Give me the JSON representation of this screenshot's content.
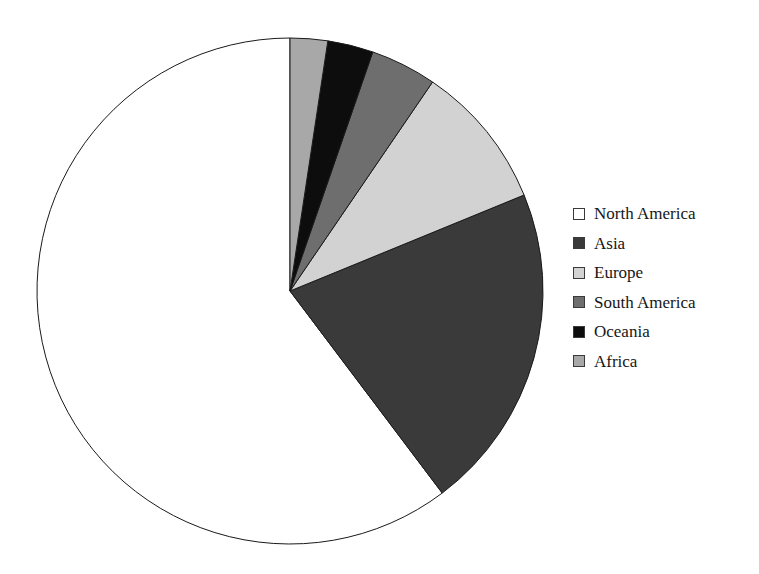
{
  "chart_data": {
    "type": "pie",
    "title": "",
    "subtitle": "",
    "xlabel": "",
    "ylabel": "",
    "grid": false,
    "legend_position": "right",
    "start_angle_deg": 0,
    "direction": "counterclockwise",
    "categories": [
      "North America",
      "Asia",
      "Europe",
      "South America",
      "Oceania",
      "Africa"
    ],
    "values": [
      60.3,
      20.9,
      9.3,
      4.2,
      2.9,
      2.4
    ],
    "value_unit": "percent",
    "slices": [
      {
        "label": "North America",
        "value": 60.3,
        "angle_deg": 217.0,
        "color": "#ffffff",
        "stroke": "#1a1a1a"
      },
      {
        "label": "Asia",
        "value": 20.9,
        "angle_deg": 75.3,
        "color": "#3a3a3a",
        "stroke": "#1a1a1a"
      },
      {
        "label": "Europe",
        "value": 9.3,
        "angle_deg": 33.4,
        "color": "#d2d2d2",
        "stroke": "#1a1a1a"
      },
      {
        "label": "South America",
        "value": 4.2,
        "angle_deg": 15.2,
        "color": "#6e6e6e",
        "stroke": "#1a1a1a"
      },
      {
        "label": "Oceania",
        "value": 2.9,
        "angle_deg": 10.5,
        "color": "#0d0d0d",
        "stroke": "#1a1a1a"
      },
      {
        "label": "Africa",
        "value": 2.4,
        "angle_deg": 8.6,
        "color": "#a8a8a8",
        "stroke": "#1a1a1a"
      }
    ],
    "geometry": {
      "center_x": 290,
      "center_y": 291,
      "radius": 253
    }
  },
  "legend": {
    "items": [
      {
        "label": "North America",
        "color": "#ffffff"
      },
      {
        "label": "Asia",
        "color": "#3a3a3a"
      },
      {
        "label": "Europe",
        "color": "#d2d2d2"
      },
      {
        "label": "South America",
        "color": "#6e6e6e"
      },
      {
        "label": "Oceania",
        "color": "#0d0d0d"
      },
      {
        "label": "Africa",
        "color": "#a8a8a8"
      }
    ]
  }
}
